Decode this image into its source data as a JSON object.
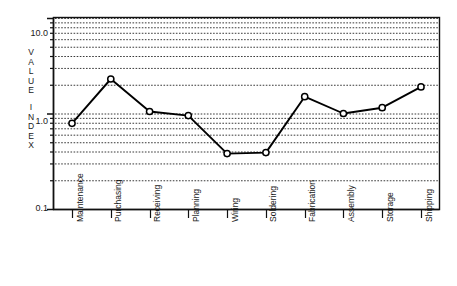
{
  "chart_data": {
    "type": "line",
    "title": "",
    "xlabel": "",
    "ylabel": "VALUE INDEX",
    "ylabel_lines": [
      "VALUE",
      "INDEX"
    ],
    "yscale": "log",
    "ylim": [
      0.1,
      10.0
    ],
    "ytick_labels": [
      "10.0",
      "1.0",
      "0.1"
    ],
    "ytick_values": [
      10.0,
      1.0,
      0.1
    ],
    "minor_gridlines": [
      0.2,
      0.3,
      0.4,
      0.5,
      0.6,
      0.7,
      0.8,
      0.9,
      2,
      3,
      4,
      5,
      6,
      7,
      8,
      9
    ],
    "grid": true,
    "legend": "none",
    "marker": "open-circle",
    "categories": [
      "Maintenance",
      "Purchasing",
      "Receiving",
      "Planning",
      "Wiring",
      "Soldering",
      "Fabrication",
      "Assembly",
      "Storage",
      "Shipping"
    ],
    "values": [
      0.79,
      2.3,
      1.05,
      0.95,
      0.38,
      0.39,
      1.5,
      1.0,
      1.15,
      1.9
    ],
    "colors": {
      "line": "#000000",
      "marker_fill": "#ffffff",
      "marker_stroke": "#000000",
      "grid": "#222222",
      "frame": "#111111",
      "background": "#ffffff"
    }
  }
}
